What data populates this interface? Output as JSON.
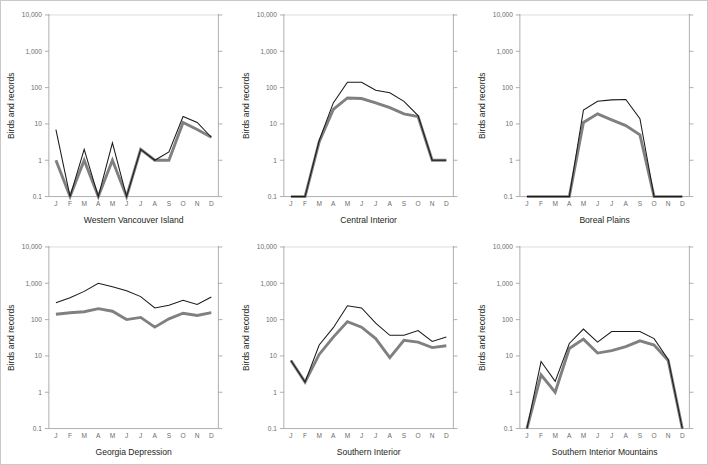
{
  "figure": {
    "panel_count": 6,
    "y_axis_title": "Birds and records",
    "y_tick_labels": [
      "10,000",
      "1,000",
      "100",
      "10",
      "1",
      "0.1"
    ],
    "y_tick_values": [
      10000,
      1000,
      100,
      10,
      1,
      0.1
    ],
    "x_tick_labels": [
      "J",
      "F",
      "M",
      "A",
      "M",
      "J",
      "J",
      "A",
      "S",
      "O",
      "N",
      "D"
    ],
    "series_colors": {
      "records": "#1a1a1a",
      "birds": "#808080"
    },
    "border_color": "#c9c9c9",
    "axis_color": "#9a9a9a",
    "gridline_color": "#d3d3d3"
  },
  "chart_data": [
    {
      "type": "line",
      "title": "Western Vancouver Island",
      "xlabel": "",
      "ylabel": "Birds and records",
      "yscale": "log",
      "ylim": [
        0.1,
        10000
      ],
      "grid": false,
      "legend": "none",
      "categories": [
        "J",
        "F",
        "M",
        "A",
        "M",
        "J",
        "J",
        "A",
        "S",
        "O",
        "N",
        "D"
      ],
      "series": [
        {
          "name": "records",
          "color": "#1a1a1a",
          "values": [
            7,
            0.1,
            2,
            0.1,
            3,
            0.1,
            2,
            1,
            1.7,
            16,
            11,
            4.3
          ]
        },
        {
          "name": "birds",
          "color": "#808080",
          "values": [
            1,
            0.1,
            1,
            0.1,
            1,
            0.1,
            2,
            1,
            1,
            11,
            7,
            4.3
          ]
        }
      ]
    },
    {
      "type": "line",
      "title": "Central Interior",
      "xlabel": "",
      "ylabel": "Birds and records",
      "yscale": "log",
      "ylim": [
        0.1,
        10000
      ],
      "grid": false,
      "legend": "none",
      "categories": [
        "J",
        "F",
        "M",
        "A",
        "M",
        "J",
        "J",
        "A",
        "S",
        "O",
        "N",
        "D"
      ],
      "series": [
        {
          "name": "records",
          "color": "#1a1a1a",
          "values": [
            0.1,
            0.1,
            3.5,
            38,
            140,
            140,
            85,
            72,
            42,
            17,
            1,
            1
          ]
        },
        {
          "name": "birds",
          "color": "#808080",
          "values": [
            0.1,
            0.1,
            3.2,
            25,
            52,
            50,
            38,
            28,
            19,
            16,
            1,
            1
          ]
        }
      ]
    },
    {
      "type": "line",
      "title": "Boreal Plains",
      "xlabel": "",
      "ylabel": "Birds and records",
      "yscale": "log",
      "ylim": [
        0.1,
        10000
      ],
      "grid": false,
      "legend": "none",
      "categories": [
        "J",
        "F",
        "M",
        "A",
        "M",
        "J",
        "J",
        "A",
        "S",
        "O",
        "N",
        "D"
      ],
      "series": [
        {
          "name": "records",
          "color": "#1a1a1a",
          "values": [
            0.1,
            0.1,
            0.1,
            0.1,
            24,
            42,
            46,
            47,
            14,
            0.1,
            0.1,
            0.1
          ]
        },
        {
          "name": "birds",
          "color": "#808080",
          "values": [
            0.1,
            0.1,
            0.1,
            0.1,
            11,
            19,
            13,
            9,
            5,
            0.1,
            0.1,
            0.1
          ]
        }
      ]
    },
    {
      "type": "line",
      "title": "Georgia Depression",
      "xlabel": "",
      "ylabel": "Birds and records",
      "yscale": "log",
      "ylim": [
        0.1,
        10000
      ],
      "grid": false,
      "legend": "none",
      "categories": [
        "J",
        "F",
        "M",
        "A",
        "M",
        "J",
        "J",
        "A",
        "S",
        "O",
        "N",
        "D"
      ],
      "series": [
        {
          "name": "records",
          "color": "#1a1a1a",
          "values": [
            290,
            400,
            600,
            1000,
            800,
            620,
            430,
            210,
            250,
            340,
            260,
            420
          ]
        },
        {
          "name": "birds",
          "color": "#808080",
          "values": [
            140,
            155,
            165,
            200,
            170,
            100,
            115,
            62,
            105,
            150,
            130,
            155
          ]
        }
      ]
    },
    {
      "type": "line",
      "title": "Southern Interior",
      "xlabel": "",
      "ylabel": "Birds and records",
      "yscale": "log",
      "ylim": [
        0.1,
        10000
      ],
      "grid": false,
      "legend": "none",
      "categories": [
        "J",
        "F",
        "M",
        "A",
        "M",
        "J",
        "J",
        "A",
        "S",
        "O",
        "N",
        "D"
      ],
      "series": [
        {
          "name": "records",
          "color": "#1a1a1a",
          "values": [
            7.5,
            1.9,
            20,
            60,
            240,
            210,
            80,
            37,
            37,
            50,
            25,
            33
          ]
        },
        {
          "name": "birds",
          "color": "#808080",
          "values": [
            7.5,
            1.9,
            11,
            33,
            88,
            62,
            30,
            9,
            27,
            24,
            17,
            19
          ]
        }
      ]
    },
    {
      "type": "line",
      "title": "Southern Interior Mountains",
      "xlabel": "",
      "ylabel": "Birds and records",
      "yscale": "log",
      "ylim": [
        0.1,
        10000
      ],
      "grid": false,
      "legend": "none",
      "categories": [
        "J",
        "F",
        "M",
        "A",
        "M",
        "J",
        "J",
        "A",
        "S",
        "O",
        "N",
        "D"
      ],
      "series": [
        {
          "name": "records",
          "color": "#1a1a1a",
          "values": [
            0.1,
            7,
            2,
            22,
            55,
            24,
            47,
            47,
            47,
            30,
            8,
            0.1
          ]
        },
        {
          "name": "birds",
          "color": "#808080",
          "values": [
            0.1,
            3,
            1,
            16,
            29,
            12,
            14,
            18,
            26,
            20,
            7.5,
            0.1
          ]
        }
      ]
    }
  ]
}
